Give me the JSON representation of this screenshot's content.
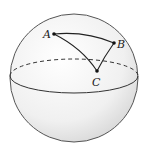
{
  "diagram": {
    "type": "spherical-triangle",
    "sphere": {
      "cx": 74,
      "cy": 78,
      "r": 64,
      "fill": "#f4f4f4",
      "stroke": "#555555"
    },
    "equator": {
      "cx": 74,
      "cy": 76,
      "rx": 64,
      "ry": 17
    },
    "points": [
      {
        "id": "A",
        "label": "A",
        "x": 54,
        "y": 34,
        "label_x": 43,
        "label_y": 38
      },
      {
        "id": "B",
        "label": "B",
        "x": 114,
        "y": 43,
        "label_x": 117,
        "label_y": 48
      },
      {
        "id": "C",
        "label": "C",
        "x": 97,
        "y": 71,
        "label_x": 92,
        "label_y": 86
      }
    ],
    "arcs": [
      "A-B",
      "A-C",
      "B-C"
    ]
  }
}
